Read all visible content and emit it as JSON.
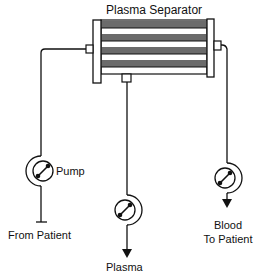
{
  "diagram": {
    "title": "Plasma Separator",
    "components": {
      "separator": {
        "label": "Plasma Separator",
        "stripe_color": "#6b6b6b",
        "line_color": "#111111"
      },
      "pump_inlet": {
        "label": "Pump",
        "icon": "pump-icon"
      },
      "pump_plasma": {
        "icon": "pump-icon"
      },
      "pump_return": {
        "icon": "pump-icon"
      }
    },
    "labels": {
      "inlet": "From Patient",
      "plasma_out": "Plasma",
      "return_line1": "Blood",
      "return_line2": "To Patient"
    },
    "flows": [
      {
        "from": "From Patient",
        "via": "Pump",
        "to": "Plasma Separator"
      },
      {
        "from": "Plasma Separator",
        "via": "pump",
        "to": "Plasma"
      },
      {
        "from": "Plasma Separator",
        "via": "pump",
        "to": "Blood To Patient"
      }
    ]
  }
}
